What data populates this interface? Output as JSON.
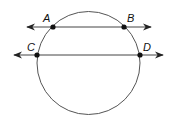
{
  "diagram": {
    "type": "circle-with-secants",
    "stroke_color": "#444444",
    "circle": {
      "cx": 88.5,
      "cy": 63,
      "r": 51.5
    },
    "lines": [
      {
        "name": "line-AB",
        "y": 27,
        "x1": 27,
        "x2": 151
      },
      {
        "name": "line-CD",
        "y": 55,
        "x1": 14,
        "x2": 163
      }
    ],
    "points": [
      {
        "label": "A",
        "x": 53,
        "y": 27,
        "lx": 45,
        "ly": 22
      },
      {
        "label": "B",
        "x": 124,
        "y": 27,
        "lx": 127,
        "ly": 22
      },
      {
        "label": "C",
        "x": 37,
        "y": 55,
        "lx": 28,
        "ly": 50
      },
      {
        "label": "D",
        "x": 140,
        "y": 55,
        "lx": 143,
        "ly": 50
      }
    ]
  }
}
